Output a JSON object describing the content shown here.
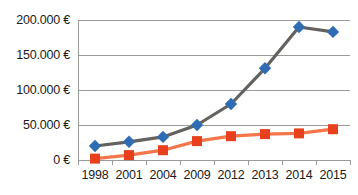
{
  "chart_data": {
    "type": "line",
    "title": "",
    "xlabel": "",
    "ylabel": "",
    "categories": [
      "1998",
      "2001",
      "2004",
      "2009",
      "2012",
      "2013",
      "2014",
      "2015"
    ],
    "ylim": [
      0,
      200000
    ],
    "yticks": [
      0,
      50000,
      100000,
      150000,
      200000
    ],
    "ytick_labels": [
      "0 €",
      "50.000 €",
      "100.000 €",
      "150.000 €",
      "200.000 €"
    ],
    "grid": true,
    "legend": "none",
    "series": [
      {
        "name": "blue-series",
        "color": "#2E6DB4",
        "line_color": "#63625F",
        "marker": "diamond",
        "values": [
          20000,
          26000,
          33000,
          50000,
          80000,
          131000,
          190000,
          183000
        ]
      },
      {
        "name": "orange-series",
        "color": "#E8401C",
        "line_color": "#F4764A",
        "marker": "square",
        "values": [
          2000,
          7000,
          14000,
          27000,
          34000,
          37000,
          38000,
          44000
        ]
      }
    ]
  },
  "colors": {
    "blue_marker": "#2E6DB4",
    "blue_line": "#63625F",
    "orange_marker": "#E8401C",
    "orange_line": "#F4764A",
    "grid": "#9a9a9a",
    "text": "#1a1a1a",
    "background": "#ffffff"
  }
}
